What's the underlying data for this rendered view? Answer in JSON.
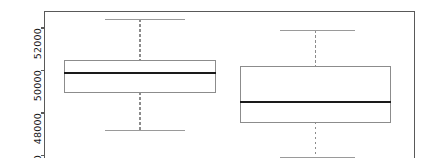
{
  "figure": {
    "background_color": "#ffffff",
    "frame_color": "#595959",
    "box_edge_color": "#8c8c8c",
    "median_color": "#1a1a1a",
    "whisker_color": "#8c8c8c",
    "cap_color": "#9a9a9a",
    "tick_color": "#595959"
  },
  "axes": {
    "plot_left_px": 44,
    "plot_top_px": 11,
    "plot_right_px": 414,
    "plot_bottom_px": 158,
    "y_tick_labels": [
      "52000",
      "50000",
      "48000",
      "46000"
    ],
    "y_tick_values": [
      52000,
      50000,
      48000,
      46000
    ],
    "y_tick_y_px": [
      27.5,
      70.0,
      112.5,
      155.0
    ],
    "y_axis_label": "",
    "x_axis_label": "",
    "x_tick_labels": [],
    "title": "",
    "grid": false,
    "legend": null
  },
  "chart_data": {
    "type": "box",
    "title": "",
    "xlabel": "",
    "ylabel": "",
    "ylim": [
      45750,
      52800
    ],
    "grid": false,
    "legend_position": "none",
    "categories": [
      "1",
      "2"
    ],
    "boxes": [
      {
        "name": "1",
        "whisker_high": 52400,
        "q3": 50470,
        "median": 49860,
        "q1": 48960,
        "whisker_low": 47180,
        "center_x_px": 139.5,
        "box_left_px": 64,
        "box_right_px": 215,
        "cap_left_px": 105,
        "cap_right_px": 185,
        "outliers": []
      },
      {
        "name": "2",
        "whisker_high": 51880,
        "q3": 50190,
        "median": 48500,
        "q1": 47560,
        "whisker_low": 45900,
        "center_x_px": 315,
        "box_left_px": 240,
        "box_right_px": 390,
        "cap_left_px": 280,
        "cap_right_px": 355,
        "outliers": []
      }
    ]
  }
}
